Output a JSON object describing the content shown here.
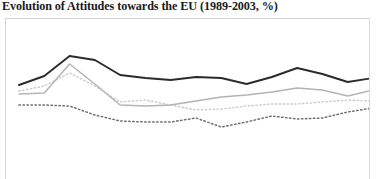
{
  "chart_title": "Evolution of Attitudes towards the EU (1989-2003, %)",
  "colors": {
    "series_1": "#2b2b2b",
    "series_2": "#b4b4b4",
    "series_3": "#c9c9c9",
    "series_4": "#6e6e6e",
    "frame_border": "#d8d8d8",
    "background": "#ffffff",
    "title_text": "#1a1a1a"
  },
  "chart_data": {
    "type": "line",
    "title": "Evolution of Attitudes towards the EU (1989-2003, %)",
    "xlabel": "",
    "ylabel": "",
    "xlim": [
      1989,
      2003
    ],
    "ylim": [
      0,
      80
    ],
    "grid": false,
    "legend": "none",
    "x": [
      1989,
      1990,
      1991,
      1992,
      1993,
      1994,
      1995,
      1996,
      1997,
      1998,
      1999,
      2000,
      2001,
      2002,
      2003
    ],
    "categories": [
      "1989",
      "1990",
      "1991",
      "1992",
      "1993",
      "1994",
      "1995",
      "1996",
      "1997",
      "1998",
      "1999",
      "2000",
      "2001",
      "2002",
      "2003"
    ],
    "series": [
      {
        "name": "series-1-dark-solid",
        "style": "solid",
        "color": "#2b2b2b",
        "values": [
          52.0,
          56.5,
          66.5,
          64.5,
          57.0,
          55.5,
          54.5,
          56.0,
          55.5,
          52.5,
          56.0,
          60.5,
          57.5,
          53.5,
          55.5
        ]
      },
      {
        "name": "series-2-light-solid",
        "style": "solid",
        "color": "#b4b4b4",
        "values": [
          47.5,
          48.0,
          62.5,
          52.5,
          42.0,
          41.5,
          42.0,
          44.0,
          46.0,
          47.0,
          48.5,
          50.5,
          49.5,
          46.5,
          49.5
        ]
      },
      {
        "name": "series-3-light-dotted",
        "style": "dotted",
        "color": "#c9c9c9",
        "values": [
          49.0,
          51.5,
          58.0,
          51.5,
          43.5,
          44.5,
          42.0,
          39.5,
          40.0,
          41.5,
          42.5,
          42.5,
          43.5,
          44.5,
          44.0
        ]
      },
      {
        "name": "series-4-dark-dotted",
        "style": "dotted",
        "color": "#6e6e6e",
        "values": [
          42.0,
          42.0,
          41.5,
          37.0,
          34.0,
          33.5,
          33.5,
          35.5,
          31.0,
          33.5,
          36.5,
          35.0,
          35.5,
          38.5,
          40.5
        ]
      }
    ]
  }
}
